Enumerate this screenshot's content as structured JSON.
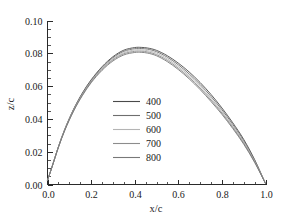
{
  "chart_data": {
    "type": "line",
    "title": "",
    "xlabel": "x/c",
    "ylabel": "z/c",
    "xlim": [
      0.0,
      1.0
    ],
    "ylim": [
      0.0,
      0.1
    ],
    "xticks": [
      "0.0",
      "0.2",
      "0.4",
      "0.6",
      "0.8",
      "1.0"
    ],
    "xtick_values": [
      0.0,
      0.2,
      0.4,
      0.6,
      0.8,
      1.0
    ],
    "yticks": [
      "0.00",
      "0.02",
      "0.04",
      "0.06",
      "0.08",
      "0.10"
    ],
    "ytick_values": [
      0.0,
      0.02,
      0.04,
      0.06,
      0.08,
      0.1
    ],
    "x_minor_per_major": 4,
    "y_minor_per_major": 4,
    "grid": false,
    "legend_position": "center",
    "axis_style": "open-left-bottom",
    "x": [
      0.0,
      0.02,
      0.05,
      0.08,
      0.12,
      0.16,
      0.2,
      0.25,
      0.3,
      0.35,
      0.4,
      0.43,
      0.46,
      0.5,
      0.55,
      0.6,
      0.65,
      0.7,
      0.75,
      0.8,
      0.85,
      0.9,
      0.95,
      1.0
    ],
    "series": [
      {
        "name": "400",
        "color": "#4a4a4a",
        "values": [
          0.0025,
          0.0105,
          0.023,
          0.034,
          0.046,
          0.0558,
          0.0638,
          0.0718,
          0.0779,
          0.0819,
          0.0835,
          0.0836,
          0.0832,
          0.0818,
          0.0785,
          0.074,
          0.0686,
          0.0622,
          0.0549,
          0.0467,
          0.0376,
          0.0275,
          0.0152,
          0.0006
        ]
      },
      {
        "name": "500",
        "color": "#6e6e6e",
        "values": [
          0.0025,
          0.0105,
          0.0229,
          0.0338,
          0.0457,
          0.0554,
          0.0634,
          0.0713,
          0.0773,
          0.0812,
          0.0828,
          0.0829,
          0.0825,
          0.081,
          0.0776,
          0.073,
          0.0674,
          0.061,
          0.0537,
          0.0456,
          0.0366,
          0.0267,
          0.0147,
          0.0006
        ]
      },
      {
        "name": "600",
        "color": "#b4b4b4",
        "values": [
          0.0025,
          0.0104,
          0.0228,
          0.0336,
          0.0454,
          0.055,
          0.0629,
          0.0707,
          0.0766,
          0.0804,
          0.082,
          0.0821,
          0.0816,
          0.0801,
          0.0766,
          0.0719,
          0.0663,
          0.0598,
          0.0525,
          0.0445,
          0.0356,
          0.0259,
          0.0142,
          0.0006
        ]
      },
      {
        "name": "700",
        "color": "#8c8c8c",
        "values": [
          0.0025,
          0.0104,
          0.0227,
          0.0334,
          0.0451,
          0.0546,
          0.0625,
          0.0702,
          0.076,
          0.0797,
          0.0812,
          0.0813,
          0.0808,
          0.0792,
          0.0757,
          0.0709,
          0.0653,
          0.0588,
          0.0515,
          0.0436,
          0.0348,
          0.0252,
          0.0138,
          0.0006
        ]
      },
      {
        "name": "800",
        "color": "#787878",
        "values": [
          0.0025,
          0.0103,
          0.0226,
          0.0332,
          0.0448,
          0.0542,
          0.062,
          0.0696,
          0.0753,
          0.079,
          0.0805,
          0.0806,
          0.0801,
          0.0785,
          0.0749,
          0.0701,
          0.0644,
          0.0579,
          0.0506,
          0.0428,
          0.0341,
          0.0246,
          0.0135,
          0.0006
        ]
      }
    ]
  },
  "legend": {
    "items": [
      {
        "label": "400"
      },
      {
        "label": "500"
      },
      {
        "label": "600"
      },
      {
        "label": "700"
      },
      {
        "label": "800"
      }
    ]
  }
}
